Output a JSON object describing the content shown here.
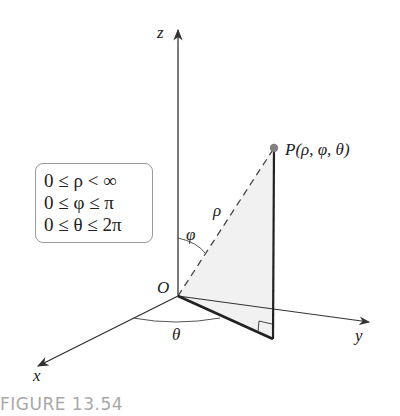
{
  "figure": {
    "caption": "FIGURE 13.54",
    "axes": {
      "z_label": "z",
      "y_label": "y",
      "x_label": "x",
      "origin_label": "O"
    },
    "point": {
      "label": "P(ρ, φ, θ)"
    },
    "angle_labels": {
      "rho": "ρ",
      "phi": "φ",
      "theta": "θ"
    },
    "ranges": [
      "0 ≤ ρ < ∞",
      "0 ≤ φ ≤ π",
      "0 ≤ θ ≤ 2π"
    ],
    "colors": {
      "axis": "#333333",
      "shade": "#f0f0f0",
      "point": "#808080",
      "caption": "#a8a8a8",
      "box_border": "#9a9a9a"
    }
  }
}
